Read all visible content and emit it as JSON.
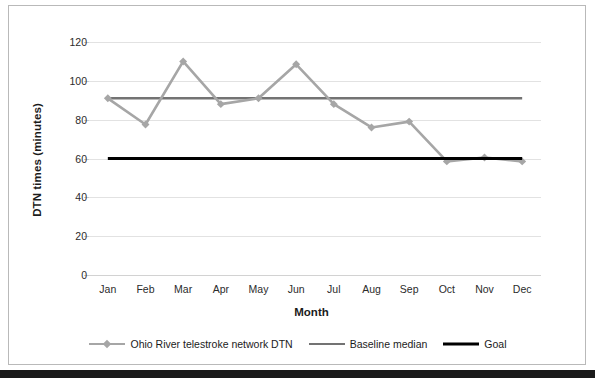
{
  "chart_data": {
    "type": "line",
    "title": "",
    "xlabel": "Month",
    "ylabel": "DTN times (minutes)",
    "categories": [
      "Jan",
      "Feb",
      "Mar",
      "Apr",
      "May",
      "Jun",
      "Jul",
      "Aug",
      "Sep",
      "Oct",
      "Nov",
      "Dec"
    ],
    "ylim": [
      0,
      120
    ],
    "yticks": [
      0,
      20,
      40,
      60,
      80,
      100,
      120
    ],
    "grid": true,
    "legend_position": "bottom",
    "series": [
      {
        "name": "Ohio River telestroke network DTN",
        "color": "#a6a6a6",
        "marker": "diamond",
        "line_width": 2.6,
        "values": [
          91,
          77.5,
          110,
          88,
          91,
          108.5,
          88,
          76,
          79,
          58.5,
          60.5,
          58.5
        ]
      },
      {
        "name": "Baseline median",
        "color": "#737373",
        "marker": "none",
        "line_width": 2.6,
        "constant": 91,
        "values": [
          91,
          91,
          91,
          91,
          91,
          91,
          91,
          91,
          91,
          91,
          91,
          91
        ]
      },
      {
        "name": "Goal",
        "color": "#000000",
        "marker": "none",
        "line_width": 3.2,
        "constant": 60,
        "values": [
          60,
          60,
          60,
          60,
          60,
          60,
          60,
          60,
          60,
          60,
          60,
          60
        ]
      }
    ]
  },
  "axis": {
    "y_title": "DTN times (minutes)",
    "x_title": "Month",
    "y_tick_labels": [
      "120",
      "100",
      "80",
      "60",
      "40",
      "20",
      "0"
    ],
    "x_tick_labels": [
      "Jan",
      "Feb",
      "Mar",
      "Apr",
      "May",
      "Jun",
      "Jul",
      "Aug",
      "Sep",
      "Oct",
      "Nov",
      "Dec"
    ]
  },
  "legend": {
    "items": [
      {
        "label": "Ohio River telestroke network DTN",
        "color": "#a6a6a6",
        "marker": "diamond"
      },
      {
        "label": "Baseline median",
        "color": "#737373",
        "marker": "none"
      },
      {
        "label": "Goal",
        "color": "#000000",
        "marker": "none"
      }
    ]
  },
  "colors": {
    "series_primary": "#a6a6a6",
    "series_baseline": "#737373",
    "series_goal": "#000000",
    "gridline": "#e2e2e2",
    "frame_border": "#b9b9b9",
    "background": "#ffffff"
  }
}
